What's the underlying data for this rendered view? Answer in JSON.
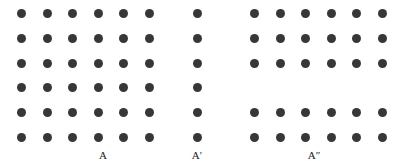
{
  "figure": {
    "width": 395,
    "height": 168,
    "background_color": "#ffffff",
    "dot_color": "#373737",
    "dot_diameter": 9,
    "label_color": "#1a1a1a"
  },
  "chart_data": {
    "type": "scatter",
    "title": "",
    "subtitle": "",
    "xlabel": "",
    "ylabel": "",
    "grid": false,
    "legend": null,
    "row_count": 6,
    "rows": [
      1,
      2,
      3,
      4,
      5,
      6
    ],
    "groups": [
      {
        "label": "A",
        "label_x": 103,
        "label_y": 150,
        "columns": 6,
        "rows_present": [
          1,
          2,
          3,
          4,
          5,
          6
        ],
        "dot_count": 36,
        "x_start": 17,
        "x_step": 25.5,
        "y_start": 9,
        "y_step": 24.8
      },
      {
        "label": "A′",
        "label_x": 197,
        "label_y": 150,
        "columns": 1,
        "rows_present": [
          1,
          2,
          3,
          4,
          5,
          6
        ],
        "dot_count": 6,
        "x_start": 193,
        "x_step": 25.5,
        "y_start": 9,
        "y_step": 24.8
      },
      {
        "label": "A″",
        "label_x": 314,
        "label_y": 150,
        "columns": 6,
        "rows_present": [
          1,
          2,
          3,
          5,
          6
        ],
        "dot_count": 30,
        "x_start": 250,
        "x_step": 25.5,
        "y_start": 9,
        "y_step": 24.8
      }
    ]
  }
}
